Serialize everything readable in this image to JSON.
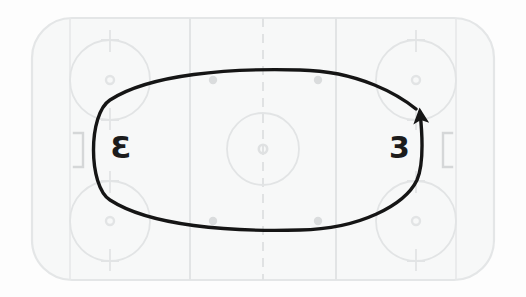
{
  "diagram": {
    "type": "rink-drill",
    "surface": {
      "name": "ice-rink",
      "fill_color": "#f7f8f8",
      "border_color": "#e4e6e7",
      "background_color": "#fdfdfd",
      "x": 32,
      "y": 18,
      "width": 462,
      "height": 262,
      "corner_radius": 40
    },
    "markings": {
      "line_color": "#e2e4e5",
      "center_line_color": "#e0e2e3",
      "center_line_style": "dashed",
      "goal_line_left_x": 70,
      "goal_line_right_x": 456,
      "blue_line_left_x": 190,
      "blue_line_right_x": 336,
      "center_line_x": 263,
      "center_circle": {
        "cx": 263,
        "cy": 149,
        "r": 36
      },
      "center_dot": {
        "cx": 263,
        "cy": 149,
        "r": 4
      },
      "faceoff_circles": [
        {
          "name": "faceoff-circle-top-left",
          "cx": 110,
          "cy": 80,
          "r": 40
        },
        {
          "name": "faceoff-circle-bottom-left",
          "cx": 110,
          "cy": 221,
          "r": 40
        },
        {
          "name": "faceoff-circle-top-right",
          "cx": 416,
          "cy": 80,
          "r": 40
        },
        {
          "name": "faceoff-circle-bottom-right",
          "cx": 416,
          "cy": 221,
          "r": 40
        }
      ],
      "neutral_zone_dots": [
        {
          "name": "neutral-dot-top-left",
          "cx": 213,
          "cy": 80,
          "r": 4
        },
        {
          "name": "neutral-dot-top-right",
          "cx": 318,
          "cy": 80,
          "r": 4
        },
        {
          "name": "neutral-dot-bottom-left",
          "cx": 213,
          "cy": 221,
          "r": 4
        },
        {
          "name": "neutral-dot-bottom-right",
          "cx": 318,
          "cy": 221,
          "r": 4
        }
      ]
    },
    "goals": [
      {
        "name": "goal-net-left",
        "glyph": "]",
        "x": 70,
        "y": 133,
        "color": "#d5d7d8"
      },
      {
        "name": "goal-net-right",
        "glyph": "[",
        "x": 452,
        "y": 133,
        "color": "#d5d7d8"
      }
    ],
    "players": [
      {
        "name": "goalie-left",
        "label": "3",
        "mirrored": true,
        "x": 110,
        "y": 149
      },
      {
        "name": "goalie-right",
        "label": "3",
        "mirrored": false,
        "x": 396,
        "y": 149
      }
    ],
    "path": {
      "name": "skating-path-oval",
      "stroke_color": "#151515",
      "stroke_width": 3.4,
      "shape": "oval-loop",
      "has_arrowhead": true,
      "arrow_direction": "counter-clockwise",
      "arrow_tip": {
        "x": 420,
        "y": 105
      },
      "bounds": {
        "cx": 256,
        "cy": 150,
        "rx": 168,
        "ry": 79
      }
    }
  }
}
